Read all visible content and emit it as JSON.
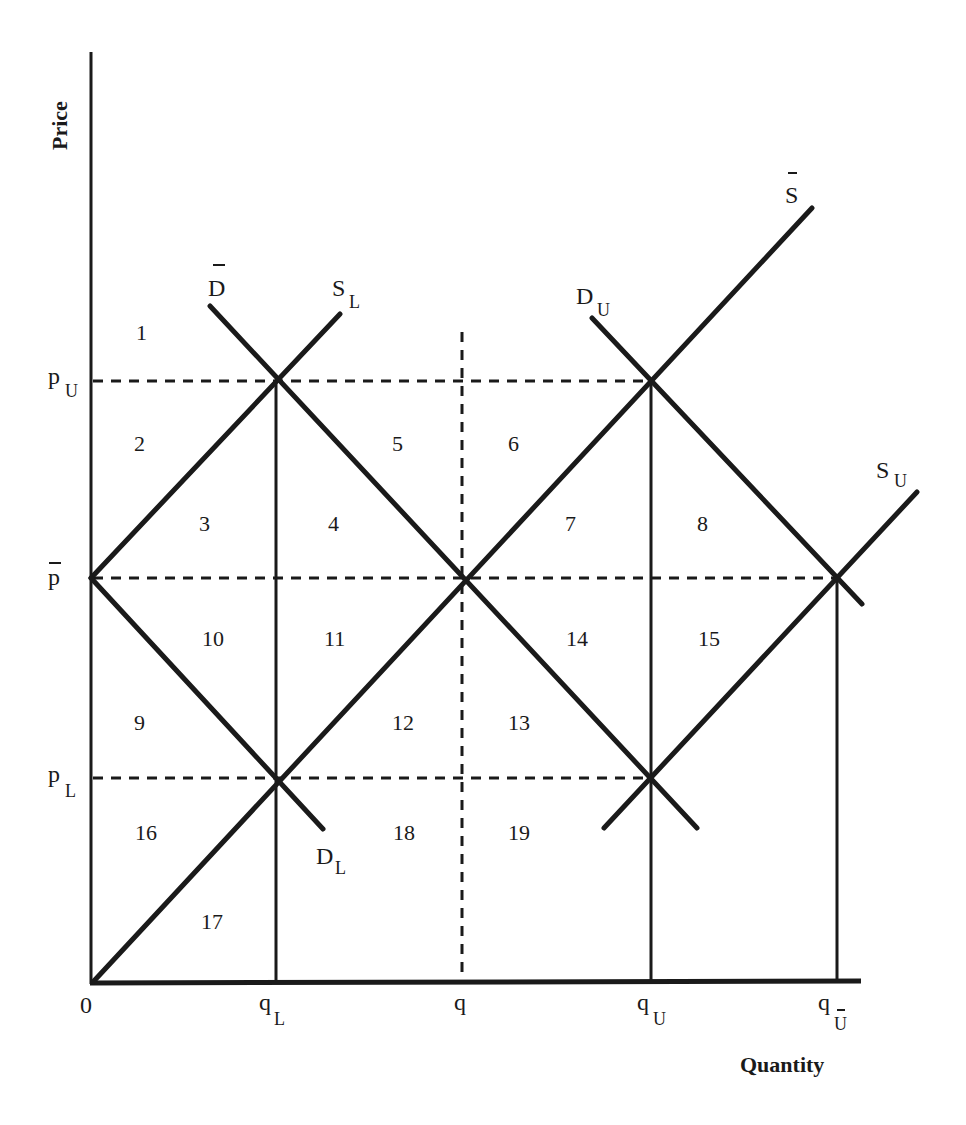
{
  "axes": {
    "y_title": "Price",
    "x_title": "Quantity",
    "origin": "0",
    "y_ticks": [
      {
        "base": "p",
        "sub": "U",
        "bar": false
      },
      {
        "base": "p",
        "sub": "",
        "bar": true
      },
      {
        "base": "p",
        "sub": "L",
        "bar": false
      }
    ],
    "x_ticks": [
      {
        "base": "q",
        "sub": "L",
        "bar": false
      },
      {
        "base": "q",
        "sub": "",
        "bar": false
      },
      {
        "base": "q",
        "sub": "U",
        "bar": false
      },
      {
        "base": "q",
        "sub": "U",
        "bar": true
      }
    ]
  },
  "curves": {
    "D_bar": {
      "base": "D",
      "sub": "",
      "bar": true
    },
    "S_L": {
      "base": "S",
      "sub": "L"
    },
    "D_U": {
      "base": "D",
      "sub": "U"
    },
    "S_bar": {
      "base": "S",
      "sub": "",
      "bar": true
    },
    "S_U": {
      "base": "S",
      "sub": "U"
    },
    "D_L": {
      "base": "D",
      "sub": "L"
    }
  },
  "regions": [
    "1",
    "2",
    "3",
    "4",
    "5",
    "6",
    "7",
    "8",
    "9",
    "10",
    "11",
    "12",
    "13",
    "14",
    "15",
    "16",
    "17",
    "18",
    "19"
  ],
  "colors": {
    "ink": "#1a1a1a",
    "background": "#ffffff"
  }
}
